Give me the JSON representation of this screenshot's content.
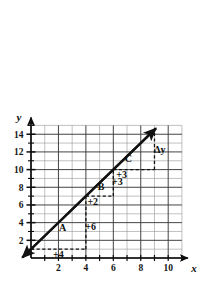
{
  "chart_data": {
    "type": "line",
    "title": "",
    "xlabel": "x",
    "ylabel": "y",
    "xlim": [
      0,
      11
    ],
    "ylim": [
      0,
      15
    ],
    "grid": true,
    "legend": null,
    "x_ticks": [
      2,
      4,
      6,
      8,
      10
    ],
    "y_ticks": [
      2,
      4,
      6,
      8,
      10,
      12,
      14
    ],
    "x_tick_labels": [
      "2",
      "4",
      "6",
      "8",
      "10"
    ],
    "y_tick_labels": [
      "2",
      "4",
      "6",
      "8",
      "10",
      "12",
      "14"
    ],
    "x_minor_step": 1,
    "y_minor_step": 1,
    "series": [
      {
        "name": "line",
        "equation": "y = 1.5x + 1",
        "slope": 1.5,
        "intercept": 1,
        "points": [
          [
            0,
            1
          ],
          [
            4,
            7
          ],
          [
            6,
            10
          ],
          [
            9,
            14.5
          ]
        ],
        "arrow_start": true,
        "arrow_end": true
      }
    ],
    "annotations": [
      {
        "label": "A",
        "x": 2.3,
        "y": 3.4,
        "kind": "triangle-name"
      },
      {
        "label": "B",
        "x": 5.1,
        "y": 8.1,
        "kind": "triangle-name"
      },
      {
        "label": "C",
        "x": 7.1,
        "y": 11.3,
        "kind": "triangle-name"
      },
      {
        "label": "+4",
        "x": 2.0,
        "y": 0.4,
        "kind": "run",
        "value": 4
      },
      {
        "label": "+6",
        "x": 4.35,
        "y": 3.6,
        "kind": "rise",
        "value": 6
      },
      {
        "label": "+2",
        "x": 4.5,
        "y": 6.4,
        "kind": "run",
        "value": 2
      },
      {
        "label": "+3",
        "x": 6.3,
        "y": 8.6,
        "kind": "rise",
        "value": 3
      },
      {
        "label": "+3",
        "x": 6.6,
        "y": 9.4,
        "kind": "run",
        "value": 3
      },
      {
        "label": "Δy",
        "x": 9.4,
        "y": 12.3,
        "kind": "delta-y"
      }
    ],
    "triangles": [
      {
        "name": "A",
        "x_start": 0,
        "x_end": 4,
        "y_base": 1,
        "y_top": 7,
        "run": 4,
        "rise": 6
      },
      {
        "name": "B",
        "x_start": 4,
        "x_end": 6,
        "y_base": 7,
        "y_top": 10,
        "run": 2,
        "rise": 3
      },
      {
        "name": "C",
        "x_start": 6,
        "x_end": 9,
        "y_base": 10,
        "y_top": 14.5,
        "run": 3,
        "rise": 4.5
      }
    ],
    "colors": {
      "line": "#111111",
      "grid_minor": "#8d8d8d",
      "grid_major": "#3a3a3a",
      "axis": "#0d0d0d",
      "dashed": "#111111",
      "background": "#ffffff"
    }
  },
  "axes": {
    "y_axis_label": "y",
    "x_axis_label": "x"
  }
}
